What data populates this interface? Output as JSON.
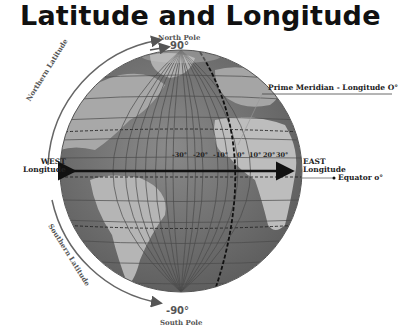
{
  "title": "Latitude and Longitude",
  "labels": {
    "north_pole": "North Pole",
    "north_deg": "90°",
    "south_pole": "South Pole",
    "south_deg": "-90°",
    "prime_meridian": "Prime Meridian - Longitude O°",
    "west_1": "WEST",
    "west_2": "Longitude",
    "east_1": "EAST",
    "east_2": "Longitude",
    "equator": "Equator o°",
    "northern_latitude": "Northern Latitude",
    "southern_latitude": "Southern Latitude"
  },
  "longitude_ticks": [
    "-30°",
    "-20°",
    "-10°",
    "0°",
    "10°",
    "20°",
    "30°"
  ],
  "colors": {
    "ocean": "#7a7a7a",
    "land": "#b8b8b8",
    "grid": "#4a4a4a",
    "text": "#333333",
    "arrow": "#555555"
  }
}
